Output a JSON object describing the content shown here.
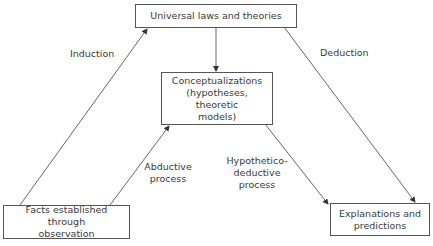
{
  "diagram": {
    "nodes": {
      "universal": {
        "text": "Universal laws and theories"
      },
      "conceptualizations": {
        "line1": "Conceptualizations",
        "line2": "(hypotheses, theoretic",
        "line3": "models)"
      },
      "facts": {
        "line1": "Facts established through",
        "line2": "observation"
      },
      "explanations": {
        "line1": "Explanations and",
        "line2": "predictions"
      }
    },
    "edges": {
      "induction": {
        "label": "Induction",
        "from": "facts",
        "to": "universal"
      },
      "deduction": {
        "label": "Deduction",
        "from": "universal",
        "to": "explanations"
      },
      "abductive": {
        "line1": "Abductive",
        "line2": "process",
        "from": "facts",
        "to": "conceptualizations"
      },
      "hypothetico": {
        "line1": "Hypothetico-",
        "line2": "deductive",
        "line3": "process",
        "from": "conceptualizations",
        "to": "explanations"
      },
      "derivation": {
        "from": "universal",
        "to": "conceptualizations"
      }
    },
    "colors": {
      "line": "#555555",
      "text": "#3a3a3a",
      "background": "#ffffff"
    }
  }
}
